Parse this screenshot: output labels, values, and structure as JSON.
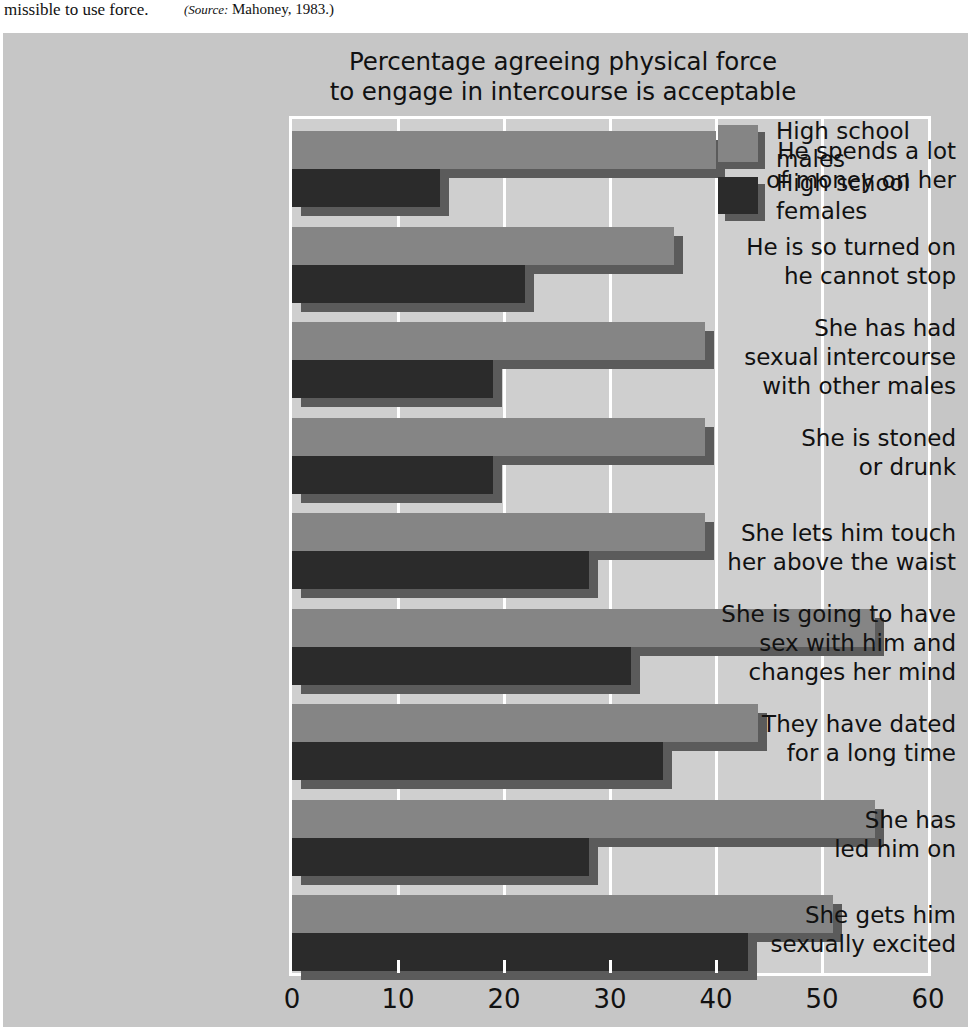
{
  "caption": {
    "text": "missible to use force.",
    "source_label": "(Source:",
    "source_value": "Mahoney, 1983.)"
  },
  "chart_data": {
    "type": "bar",
    "orientation": "horizontal",
    "title": "Percentage agreeing physical force\nto engage in intercourse is acceptable",
    "title_line1": "Percentage agreeing physical force",
    "title_line2": "to engage in intercourse is acceptable",
    "xlabel": "",
    "ylabel": "",
    "xlim": [
      0,
      60
    ],
    "xticks": [
      0,
      10,
      20,
      30,
      40,
      50,
      60
    ],
    "xtick_labels": [
      "0",
      "10",
      "20",
      "30",
      "40",
      "50",
      "60"
    ],
    "grid": true,
    "legend_position": "top-right",
    "categories": [
      "He spends a lot\nof money on her",
      "He is so turned on\nhe cannot stop",
      "She has had\nsexual intercourse\nwith other males",
      "She is stoned\nor drunk",
      "She lets him touch\nher above the waist",
      "She is going to have\nsex with him and\nchanges her mind",
      "They have dated\nfor a long time",
      "She has\nled him on",
      "She gets him\nsexually excited"
    ],
    "series": [
      {
        "name": "High school males",
        "name_line1": "High school",
        "name_line2": "males",
        "color": "#858585",
        "values": [
          40,
          36,
          39,
          39,
          39,
          55,
          44,
          55,
          51
        ]
      },
      {
        "name": "High school females",
        "name_line1": "High school",
        "name_line2": "females",
        "color": "#2b2b2b",
        "values": [
          14,
          22,
          19,
          19,
          28,
          32,
          35,
          28,
          43
        ]
      }
    ]
  },
  "colors": {
    "panel_background": "#c6c6c6",
    "plot_background": "#cfcfcf",
    "gridline": "#ffffff",
    "shadow": "#5b5b5b",
    "text": "#111111"
  }
}
